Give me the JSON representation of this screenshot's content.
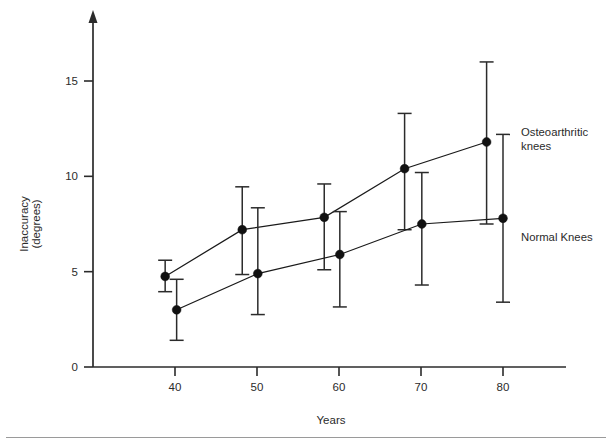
{
  "chart_data": {
    "type": "line",
    "title": "",
    "xlabel": "Years",
    "ylabel": "Inaccuracy\n(degrees)",
    "ylabel_line1": "Inaccuracy",
    "ylabel_line2": "(degrees)",
    "x_ticks": [
      40,
      50,
      60,
      70,
      80
    ],
    "y_ticks": [
      0,
      5,
      10,
      15
    ],
    "xlim": [
      34,
      84
    ],
    "ylim": [
      0,
      18
    ],
    "grid": false,
    "legend_position": "right-inline-annotations",
    "error_bars": "vertical with caps",
    "series": [
      {
        "name": "Osteoarthritic knees",
        "marker": "filled-circle",
        "x": [
          38.8,
          48.2,
          58.2,
          68.0,
          78.0
        ],
        "values": [
          4.75,
          7.2,
          7.85,
          10.4,
          11.8
        ],
        "err_low": [
          3.95,
          4.85,
          5.1,
          7.2,
          7.5
        ],
        "err_high": [
          5.6,
          9.45,
          9.6,
          13.3,
          16.0
        ]
      },
      {
        "name": "Normal Knees",
        "marker": "filled-circle",
        "x": [
          40.2,
          50.1,
          60.1,
          70.1,
          80.0
        ],
        "values": [
          3.0,
          4.9,
          5.9,
          7.5,
          7.8
        ],
        "err_low": [
          1.4,
          2.75,
          3.15,
          4.3,
          3.4
        ],
        "err_high": [
          4.6,
          8.35,
          8.15,
          10.2,
          12.2
        ]
      }
    ],
    "annotations": [
      {
        "text": "Osteoarthritic\nknees",
        "for_series": "Osteoarthritic knees"
      },
      {
        "text": "Normal Knees",
        "for_series": "Normal Knees"
      }
    ],
    "colors": {
      "axis": "#2b2b2b",
      "series_osteoarthritic": "#111111",
      "series_normal": "#111111",
      "background": "#ffffff",
      "rule": "#9a9a9a"
    }
  },
  "axis_labels": {
    "x_title": "Years",
    "y_title_line1": "Inaccuracy",
    "y_title_line2": "(degrees)"
  },
  "ticks": {
    "x": [
      "40",
      "50",
      "60",
      "70",
      "80"
    ],
    "y": [
      "0",
      "5",
      "10",
      "15"
    ]
  },
  "annotations": {
    "osteoarthritic": "Osteoarthritic\nknees",
    "normal": "Normal Knees"
  }
}
